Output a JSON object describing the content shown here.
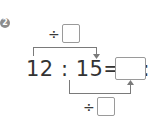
{
  "problem": {
    "number": "2",
    "top_operator": "÷",
    "bottom_operator": "÷",
    "equation_left": "12 : 15=4 :",
    "answer_box_value": "",
    "top_divisor_value": "",
    "bottom_divisor_value": ""
  },
  "colors": {
    "text": "#333333",
    "lines": "#7a7a7a",
    "box_border": "#9a9a9a",
    "badge": "#8c8c8c"
  }
}
